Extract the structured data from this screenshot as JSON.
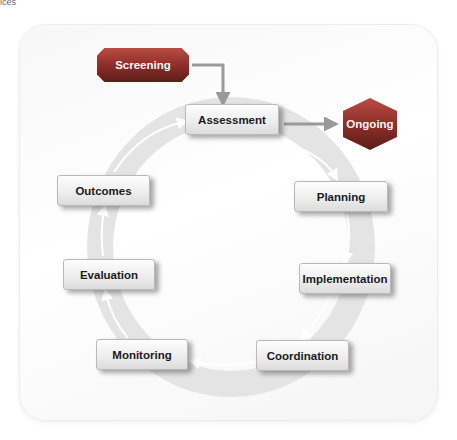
{
  "corner_text": "ices",
  "diagram": {
    "start": {
      "label": "Screening",
      "shape": "octagon",
      "color": "#8e2f29"
    },
    "exit": {
      "label": "Ongoing",
      "shape": "hexagon",
      "color": "#8e2f29"
    },
    "cycle_steps": [
      {
        "label": "Assessment"
      },
      {
        "label": "Planning"
      },
      {
        "label": "Implementation"
      },
      {
        "label": "Coordination"
      },
      {
        "label": "Monitoring"
      },
      {
        "label": "Evaluation"
      },
      {
        "label": "Outcomes"
      }
    ],
    "edges": [
      {
        "from": "Screening",
        "to": "Assessment"
      },
      {
        "from": "Assessment",
        "to": "Ongoing"
      },
      {
        "from": "Assessment",
        "to": "Planning"
      },
      {
        "from": "Planning",
        "to": "Implementation"
      },
      {
        "from": "Implementation",
        "to": "Coordination"
      },
      {
        "from": "Coordination",
        "to": "Monitoring"
      },
      {
        "from": "Monitoring",
        "to": "Evaluation"
      },
      {
        "from": "Evaluation",
        "to": "Outcomes"
      },
      {
        "from": "Outcomes",
        "to": "Assessment"
      }
    ],
    "ring_color": "#e6e6e6",
    "arrow_color": "#9a9a9a"
  }
}
